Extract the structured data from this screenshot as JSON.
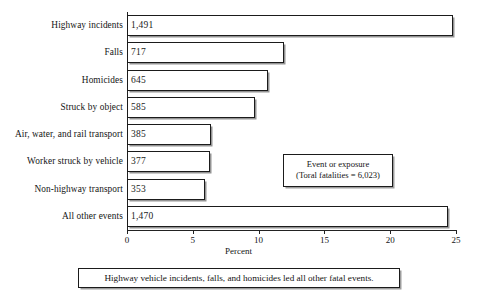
{
  "chart_data": {
    "type": "bar",
    "orientation": "horizontal",
    "title": "",
    "xlabel": "Percent",
    "ylabel": "",
    "xlim": [
      0,
      25
    ],
    "xticks": [
      0,
      5,
      10,
      15,
      20,
      25
    ],
    "xtick_labels": [
      "0",
      "5",
      "10",
      "15",
      "20",
      "25"
    ],
    "grid": false,
    "legend_position": "inside-right",
    "categories": [
      "Highway incidents",
      "Falls",
      "Homicides",
      "Struck by object",
      "Air, water, and rail transport",
      "Worker struck by vehicle",
      "Non-highway transport",
      "All other events"
    ],
    "counts": [
      1491,
      717,
      645,
      585,
      385,
      377,
      353,
      1470
    ],
    "count_labels": [
      "1,491",
      "717",
      "645",
      "585",
      "385",
      "377",
      "353",
      "1,470"
    ],
    "values": [
      24.8,
      11.9,
      10.7,
      9.7,
      6.4,
      6.3,
      5.9,
      24.4
    ],
    "bar_face_color": "#ffffff",
    "bar_edge_color": "#1b1b1b"
  },
  "legend": {
    "line1": "Event or exposure",
    "line2": "(Toral fatalities = 6,023)"
  },
  "caption": {
    "text": "Highway vehicle incidents, falls, and homicides led all other fatal events."
  }
}
